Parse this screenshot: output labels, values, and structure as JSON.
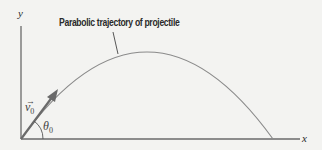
{
  "diagram": {
    "title_label": "Parabolic trajectory of projectile",
    "axes": {
      "x_label": "x",
      "y_label": "y"
    },
    "velocity": {
      "symbol": "v",
      "subscript": "0",
      "arrow_glyph": "→"
    },
    "angle": {
      "symbol": "θ",
      "subscript": "0"
    },
    "colors": {
      "background": "#f3f3f1",
      "axis": "#6a6a6a",
      "trajectory": "#8a8a8a",
      "velocity_arrow": "#6a6a6a",
      "text": "#2a2a2a"
    }
  }
}
